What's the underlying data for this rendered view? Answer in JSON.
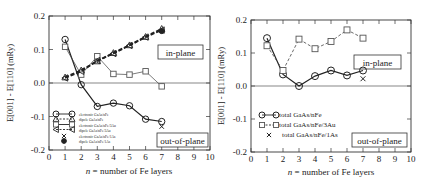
{
  "chart_data": [
    {
      "type": "line",
      "title": "",
      "xlabel": "n = number of Fe layers",
      "ylabel": "E[001] - E[110] (mRy)",
      "xlim": [
        0,
        10
      ],
      "ylim": [
        -0.2,
        0.2
      ],
      "xticks": [
        "0",
        "1",
        "2",
        "3",
        "4",
        "5",
        "6",
        "7",
        "8",
        "9",
        "10"
      ],
      "yticks": [
        "-0.2",
        "-0.1",
        "0.0",
        "0.1",
        "0.2"
      ],
      "grid": false,
      "zero_line": true,
      "annotations": [
        "in-plane",
        "out-of-plane"
      ],
      "legend_position": "lower left",
      "x": [
        1,
        2,
        3,
        4,
        5,
        6,
        7
      ],
      "series": [
        {
          "name": "electronic GaAs/nFe",
          "marker": "circle",
          "line": "solid",
          "values": [
            0.13,
            -0.005,
            -0.07,
            -0.06,
            -0.068,
            -0.108,
            -0.115
          ]
        },
        {
          "name": "dipole GaAs/nFe",
          "marker": "triangle-up",
          "line": "dashed",
          "values": [
            0.017,
            0.038,
            0.065,
            0.09,
            0.113,
            0.138,
            0.162
          ]
        },
        {
          "name": "electronic GaAs/nFe/3Au",
          "marker": "square",
          "line": "solid-thin",
          "values": [
            0.108,
            0.025,
            0.08,
            0.027,
            0.025,
            0.035,
            -0.01
          ]
        },
        {
          "name": "dipole GaAs/nFe/3Au",
          "marker": "triangle-left",
          "line": "dashed",
          "values": [
            0.015,
            0.035,
            0.067,
            0.088,
            0.112,
            0.137,
            0.158
          ]
        },
        {
          "name": "electronic GaAs/nFe/1As",
          "marker": "x",
          "line": "none",
          "x": [
            7
          ],
          "values": [
            -0.13
          ]
        },
        {
          "name": "dipole GaAs/nFe/1As",
          "marker": "filled-star",
          "line": "none",
          "x": [
            7
          ],
          "values": [
            0.155
          ]
        }
      ]
    },
    {
      "type": "line",
      "title": "",
      "xlabel": "n = number of Fe layers",
      "ylabel": "E[001] - E[110] (mRy)",
      "xlim": [
        0,
        10
      ],
      "ylim": [
        -0.2,
        0.2
      ],
      "xticks": [
        "0",
        "1",
        "2",
        "3",
        "4",
        "5",
        "6",
        "7",
        "8",
        "9",
        "10"
      ],
      "yticks": [
        "-0.2",
        "-0.1",
        "0.0",
        "0.1",
        "0.2"
      ],
      "grid": false,
      "zero_line": true,
      "annotations": [
        "in-plane",
        "out-of-plane"
      ],
      "legend_position": "lower left",
      "x": [
        1,
        2,
        3,
        4,
        5,
        6,
        7
      ],
      "series": [
        {
          "name": "total GaAs/nFe",
          "marker": "circle",
          "line": "solid",
          "values": [
            0.145,
            0.035,
            0.0,
            0.03,
            0.047,
            0.032,
            0.047
          ]
        },
        {
          "name": "total GaAs/nFe/3Au",
          "marker": "square",
          "line": "dashed",
          "values": [
            0.122,
            0.047,
            0.142,
            0.113,
            0.135,
            0.17,
            0.145
          ]
        },
        {
          "name": "total GaAs/nFe/1As",
          "marker": "x",
          "line": "none",
          "x": [
            7
          ],
          "values": [
            0.022
          ]
        }
      ]
    }
  ],
  "left": {
    "ylabel": "E[001] - E[110] (mRy)",
    "xlabel_n": "n",
    "xlabel_rest": " = number of Fe layers",
    "in_plane": "in-plane",
    "out_of_plane": "out-of-plane",
    "yticks": [
      "0.2",
      "0.1",
      "0.0",
      "-0.1",
      "-0.2"
    ],
    "xticks": [
      "0",
      "1",
      "2",
      "3",
      "4",
      "5",
      "6",
      "7",
      "8",
      "9",
      "10"
    ],
    "legend": [
      "electronic GaAs/nFe",
      "dipole GaAs/nFe",
      "electronic GaAs/nFe/3Au",
      "dipole GaAs/nFe/3Au",
      "electronic GaAs/nFe/1As",
      "dipole GaAs/nFe/1As"
    ]
  },
  "right": {
    "ylabel": "E[001] - E[110] (mRy)",
    "xlabel_n": "n",
    "xlabel_rest": " = number of Fe layers",
    "in_plane": "in-plane",
    "out_of_plane": "out-of-plane",
    "yticks": [
      "0.2",
      "0.1",
      "0.0",
      "-0.1",
      "-0.2"
    ],
    "xticks": [
      "0",
      "1",
      "2",
      "3",
      "4",
      "5",
      "6",
      "7",
      "8",
      "9",
      "10"
    ],
    "legend": [
      "total GaAs/nFe",
      "total GaAs/nFe/3Au",
      "total GaAs/nFe/1As"
    ]
  },
  "colors": {
    "line": "#222222",
    "marker_gray": "#555555",
    "background": "#ffffff"
  }
}
